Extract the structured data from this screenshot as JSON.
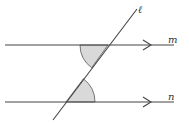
{
  "diagram": {
    "labels": {
      "transversal": "ℓ",
      "line_top": "m",
      "line_bottom": "n"
    },
    "colors": {
      "line": "#444444",
      "angle_fill": "#d9d9d9"
    }
  }
}
